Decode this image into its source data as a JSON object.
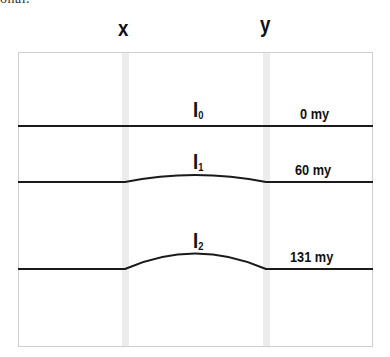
{
  "clipped_text": "onal.",
  "columns": [
    {
      "label": "x"
    },
    {
      "label": "y"
    }
  ],
  "layers": [
    {
      "label": "I",
      "subscript": "0",
      "age": "0 my"
    },
    {
      "label": "I",
      "subscript": "1",
      "age": "60 my"
    },
    {
      "label": "I",
      "subscript": "2",
      "age": "131 my"
    }
  ],
  "colors": {
    "line": "#1a1a1a",
    "frame": "#cfcfcf",
    "band": "#ececec"
  }
}
